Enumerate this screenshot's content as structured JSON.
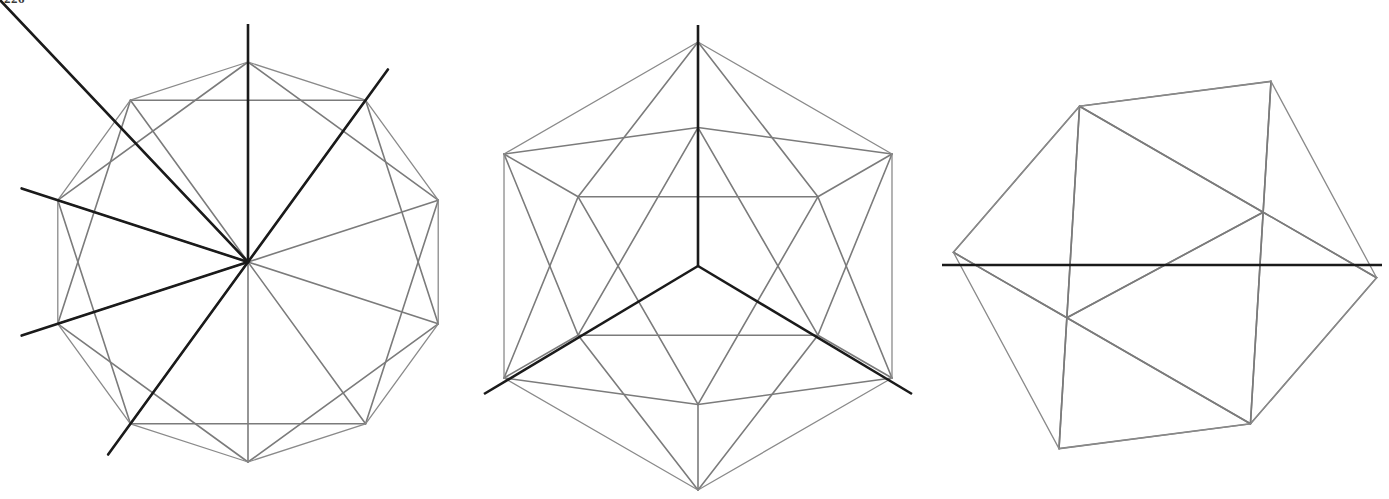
{
  "page": {
    "page_number": "226",
    "background_color": "#ffffff",
    "width": 1389,
    "height": 499
  },
  "style": {
    "hull_color": "#8a8a8a",
    "edge_color": "#7b7b7b",
    "axis_color": "#1a1a1a",
    "hull_stroke_width": 1.3,
    "edge_stroke_width": 1.6,
    "axis_stroke_width": 2.6
  },
  "chart_data": {
    "type": "diagram",
    "figure_count": 3,
    "figures": [
      {
        "index": 1,
        "name": "icosahedron-fivefold-axis-view",
        "label": "five-fold axis projection",
        "axis_order": 5,
        "axis_type": "vertex axis",
        "outline_shape": "decagon",
        "center": [
          248,
          262
        ],
        "radius": 200,
        "rotation_deg": -90,
        "axis_lines": [
          {
            "name": "vertical-axis",
            "from": [
              248,
              24
            ],
            "to": [
              248,
              262
            ],
            "note": "projected five-fold axis, seen end-on at center"
          }
        ],
        "star_rays": 5,
        "star_ray_overshoot": 38,
        "description": "Icosahedron seen down a vertex (5-fold) axis; five heavy edges radiate from the central vertex to an inner pentagon, outlined by a light decagon silhouette."
      },
      {
        "index": 2,
        "name": "icosahedron-threefold-axis-view",
        "label": "three-fold axis projection",
        "axis_order": 3,
        "axis_type": "face axis",
        "outline_shape": "hexagon",
        "center": [
          698,
          266
        ],
        "radius": 224,
        "rotation_deg": -90,
        "axis_lines": [
          {
            "name": "vertical-axis",
            "from": [
              698,
              25
            ],
            "to": [
              698,
              266
            ]
          },
          {
            "name": "lower-left-axis",
            "from": [
              698,
              266
            ],
            "to": [
              484,
              394
            ]
          },
          {
            "name": "lower-right-axis",
            "from": [
              698,
              266
            ],
            "to": [
              912,
              394
            ]
          }
        ],
        "star_rays": 3,
        "description": "Icosahedron seen down a face (3-fold) axis; three heavy edges form a Y from the centre of the projected triangle, hexagonal silhouette."
      },
      {
        "index": 3,
        "name": "icosahedron-twofold-axis-view",
        "label": "two-fold axis projection",
        "axis_order": 2,
        "axis_type": "edge axis",
        "outline_shape": "hexagon",
        "center": [
          1165,
          265
        ],
        "radius": 212,
        "rotation_deg": -90,
        "axis_lines": [
          {
            "name": "horizontal-axis",
            "from": [
              942,
              265
            ],
            "to": [
              1382,
              265
            ]
          }
        ],
        "star_rays": 0,
        "description": "Icosahedron seen down an edge (2-fold) axis; a single heavy horizontal line runs through the two central vertices of the hexagonal silhouette."
      }
    ]
  }
}
